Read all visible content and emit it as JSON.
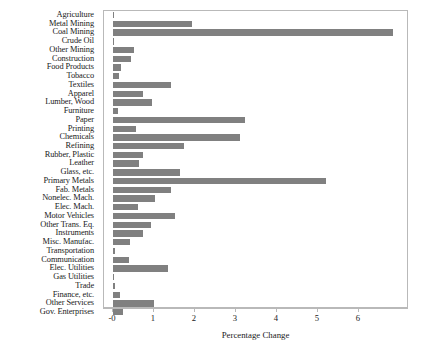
{
  "chart_data": {
    "type": "bar",
    "orientation": "horizontal",
    "title": "",
    "xlabel": "Percentage Change",
    "ylabel": "",
    "xlim": [
      -0.22,
      7.2
    ],
    "xticks": [
      0,
      1,
      2,
      3,
      4,
      5,
      6
    ],
    "xtick_labels": [
      "-0",
      "1",
      "2",
      "3",
      "4",
      "5",
      "6"
    ],
    "grid": false,
    "legend": null,
    "bar_color": "#808080",
    "frame_color": "#b9b9b9",
    "categories": [
      "Agriculture",
      "Metal Mining",
      "Coal Mining",
      "Crude Oil",
      "Other Mining",
      "Construction",
      "Food Products",
      "Tobacco",
      "Textiles",
      "Apparel",
      "Lumber, Wood",
      "Furniture",
      "Paper",
      "Printing",
      "Chemicals",
      "Refining",
      "Rubber, Plastic",
      "Leather",
      "Glass, etc.",
      "Primary Metals",
      "Fab. Metals",
      "Nonelec. Mach.",
      "Elec. Mach.",
      "Motor Vehicles",
      "Other Trans. Eq.",
      "Instruments",
      "Misc. Manufac.",
      "Transportation",
      "Communication",
      "Elec. Utilities",
      "Gas Utilities",
      "Trade",
      "Finance, etc.",
      "Other Services",
      "Gov. Enterprises"
    ],
    "values": [
      0.02,
      1.93,
      6.83,
      0.03,
      0.52,
      0.45,
      0.19,
      0.14,
      1.41,
      0.72,
      0.95,
      0.13,
      3.22,
      0.55,
      3.1,
      1.72,
      0.72,
      0.63,
      1.63,
      5.2,
      1.42,
      1.02,
      0.62,
      1.52,
      0.93,
      0.72,
      0.42,
      0.06,
      0.4,
      1.33,
      0.03,
      0.06,
      0.17,
      1.01,
      0.24
    ]
  }
}
